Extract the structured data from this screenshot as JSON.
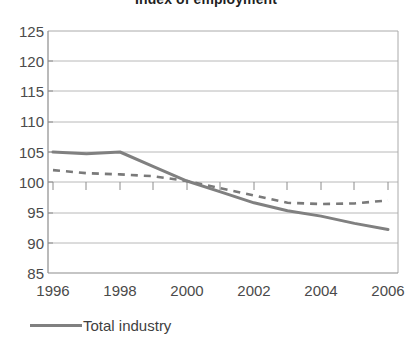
{
  "chart_data": {
    "type": "line",
    "title": "Index of employment",
    "xlabel": "",
    "ylabel": "",
    "xlim": [
      1996,
      2006
    ],
    "ylim": [
      85,
      125
    ],
    "yticks": [
      85,
      90,
      95,
      100,
      105,
      110,
      115,
      120,
      125
    ],
    "xticks": [
      1996,
      1998,
      2000,
      2002,
      2004,
      2006
    ],
    "x": [
      1996,
      1997,
      1998,
      1999,
      2000,
      2001,
      2002,
      2003,
      2004,
      2005,
      2006
    ],
    "grid": "horizontal",
    "legend_position": "bottom-left",
    "series": [
      {
        "name": "Total industry",
        "style": "solid",
        "color": "#808080",
        "values": [
          105.0,
          104.7,
          105.0,
          102.6,
          100.2,
          98.4,
          96.6,
          95.3,
          94.4,
          93.2,
          92.2
        ]
      },
      {
        "name": "",
        "style": "dashed",
        "color": "#7a7a7a",
        "values": [
          102.0,
          101.5,
          101.3,
          101.0,
          100.2,
          99.0,
          97.8,
          96.6,
          96.4,
          96.5,
          97.0
        ]
      }
    ]
  },
  "axis": {
    "y_labels": [
      "125",
      "120",
      "115",
      "110",
      "105",
      "100",
      "95",
      "90",
      "85"
    ],
    "x_labels": [
      "1996",
      "1998",
      "2000",
      "2002",
      "2004",
      "2006"
    ]
  },
  "legend": {
    "items": [
      {
        "label": "Total industry",
        "color": "#808080"
      }
    ]
  },
  "colors": {
    "series_solid": "#808080",
    "series_dashed": "#7a7a7a",
    "grid": "#b8b8b8",
    "axis": "#8c8c8c",
    "text": "#4a4a4a",
    "background": "#ffffff"
  }
}
